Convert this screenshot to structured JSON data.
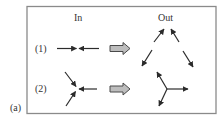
{
  "panel_label": "(a)",
  "columns": {
    "in": "In",
    "out": "Out"
  },
  "rows": [
    {
      "label": "(1)",
      "in_description": "two arrows pointing toward each other (head-on)",
      "out_description": "two pairs of arrows diverging in a V / triangle shape"
    },
    {
      "label": "(2)",
      "in_description": "three arrows converging to a point",
      "out_description": "three arrows radiating from a junction"
    }
  ],
  "colors": {
    "border": "#8a8a8a",
    "arrow": "#2b2b2b",
    "block_arrow_fill": "#bdbdbd",
    "block_arrow_stroke": "#4a4a4a",
    "text": "#333333"
  }
}
